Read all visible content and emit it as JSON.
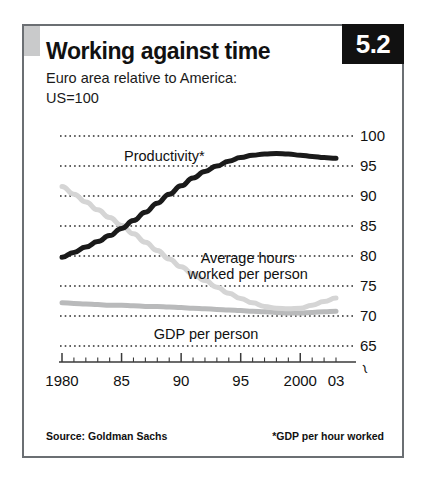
{
  "figure": {
    "badge": "5.2",
    "title": "Working against time",
    "subtitle_line1": "Euro area relative to America:",
    "subtitle_line2": "US=100",
    "source": "Source: Goldman Sachs",
    "footnote": "*GDP per hour worked",
    "axis_break_symbol": "≀"
  },
  "chart_data": {
    "type": "line",
    "title": "Working against time",
    "subtitle": "Euro area relative to America: US=100",
    "xlabel": "",
    "ylabel": "",
    "xlim": [
      1980,
      2003
    ],
    "ylim": [
      63.5,
      100
    ],
    "grid": true,
    "grid_style": "dotted-horizontal",
    "legend": "inline-annotations",
    "yticks": [
      100,
      95,
      90,
      85,
      80,
      75,
      70,
      65
    ],
    "ytick_labels": [
      "100",
      "95",
      "90",
      "85",
      "80",
      "75",
      "70",
      "65"
    ],
    "xticks": [
      1980,
      1985,
      1990,
      1995,
      2000,
      2003
    ],
    "xtick_labels": [
      "1980",
      "85",
      "90",
      "95",
      "2000",
      "03"
    ],
    "minor_xticks_every": 1,
    "x": [
      1980,
      1981,
      1982,
      1983,
      1984,
      1985,
      1986,
      1987,
      1988,
      1989,
      1990,
      1991,
      1992,
      1993,
      1994,
      1995,
      1996,
      1997,
      1998,
      1999,
      2000,
      2001,
      2002,
      2003
    ],
    "series": [
      {
        "name": "Productivity*",
        "color": "#1a1a1a",
        "width": 5,
        "label_text": "Productivity*",
        "values": [
          79.8,
          80.6,
          81.5,
          82.4,
          83.4,
          84.6,
          85.9,
          87.3,
          88.8,
          90.3,
          91.7,
          93.0,
          94.1,
          95.0,
          95.8,
          96.4,
          96.8,
          97.0,
          97.1,
          97.0,
          96.8,
          96.6,
          96.4,
          96.3
        ]
      },
      {
        "name": "Average hours worked per person",
        "color": "#d5d5d5",
        "width": 5,
        "label_text": "Average hours\nworked per person",
        "values": [
          91.6,
          90.3,
          89.0,
          87.7,
          86.4,
          85.1,
          83.7,
          82.3,
          80.9,
          79.5,
          78.2,
          77.0,
          75.9,
          74.8,
          73.8,
          72.9,
          72.2,
          71.6,
          71.3,
          71.2,
          71.3,
          71.8,
          72.4,
          73.0
        ]
      },
      {
        "name": "GDP per person",
        "color": "#b9babb",
        "width": 5,
        "label_text": "GDP per person",
        "values": [
          72.2,
          72.1,
          72.0,
          71.9,
          71.8,
          71.8,
          71.7,
          71.6,
          71.6,
          71.5,
          71.4,
          71.3,
          71.2,
          71.1,
          71.0,
          70.9,
          70.8,
          70.7,
          70.6,
          70.5,
          70.5,
          70.6,
          70.7,
          70.8
        ]
      }
    ],
    "annotations": [
      {
        "text": "Productivity*",
        "x": 1987.5,
        "y": 96.5
      },
      {
        "text": "Average hours worked per person",
        "x": 1994.5,
        "y": 79.5
      },
      {
        "text": "GDP per person",
        "x": 1991.0,
        "y": 66.8
      }
    ]
  }
}
